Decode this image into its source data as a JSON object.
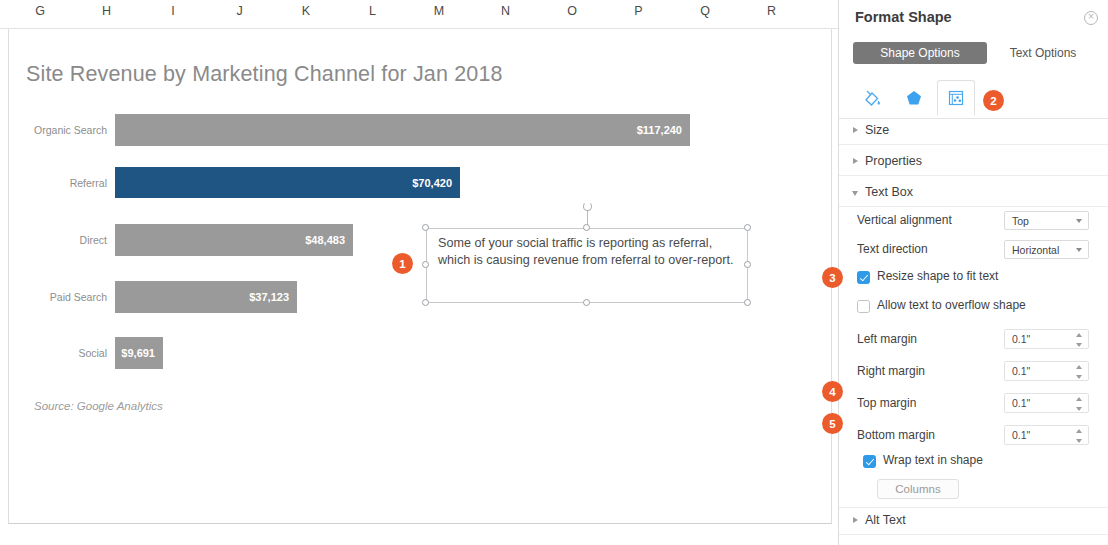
{
  "spreadsheet": {
    "columns": [
      "G",
      "H",
      "I",
      "J",
      "K",
      "L",
      "M",
      "N",
      "O",
      "P",
      "Q",
      "R"
    ]
  },
  "chart_data": {
    "type": "bar",
    "orientation": "horizontal",
    "title": "Site Revenue by Marketing Channel for Jan 2018",
    "source": "Source: Google Analytics",
    "xlabel": "",
    "ylabel": "",
    "grid": false,
    "legend": "none",
    "xlim": [
      0,
      117240
    ],
    "categories": [
      "Organic Search",
      "Referral",
      "Direct",
      "Paid Search",
      "Social"
    ],
    "values": [
      117240,
      70420,
      48483,
      37123,
      9691
    ],
    "value_labels": [
      "$117,240",
      "$70,420",
      "$48,483",
      "$37,123",
      "$9,691"
    ],
    "colors": [
      "#9a9a9a",
      "#1f5582",
      "#9a9a9a",
      "#9a9a9a",
      "#9a9a9a"
    ],
    "highlight_category": "Referral",
    "highlight_color": "#1f5582",
    "base_color": "#9a9a9a"
  },
  "annotation": {
    "text": "Some of your social traffic is reporting as referral, which is causing revenue from referral to over-report."
  },
  "badges": [
    {
      "label": "1"
    },
    {
      "label": "2"
    },
    {
      "label": "3"
    },
    {
      "label": "4"
    },
    {
      "label": "5"
    }
  ],
  "panel": {
    "title": "Format Shape",
    "close_icon": "close-icon",
    "tabs": [
      {
        "label": "Shape Options",
        "active": true
      },
      {
        "label": "Text Options",
        "active": false
      }
    ],
    "icon_tabs": [
      {
        "name": "fill-line-icon",
        "selected": false
      },
      {
        "name": "effects-pentagon-icon",
        "selected": false
      },
      {
        "name": "size-properties-icon",
        "selected": true
      }
    ],
    "sections": [
      {
        "label": "Size",
        "expanded": false
      },
      {
        "label": "Properties",
        "expanded": false
      },
      {
        "label": "Text Box",
        "expanded": true
      },
      {
        "label": "Alt Text",
        "expanded": false
      }
    ],
    "text_box": {
      "vertical_alignment": {
        "label": "Vertical alignment",
        "value": "Top"
      },
      "text_direction": {
        "label": "Text direction",
        "value": "Horizontal"
      },
      "resize_shape": {
        "label": "Resize shape to fit text",
        "checked": true
      },
      "allow_overflow": {
        "label": "Allow text to overflow shape",
        "checked": false
      },
      "left_margin": {
        "label": "Left margin",
        "value": "0.1\""
      },
      "right_margin": {
        "label": "Right margin",
        "value": "0.1\""
      },
      "top_margin": {
        "label": "Top margin",
        "value": "0.1\""
      },
      "bottom_margin": {
        "label": "Bottom margin",
        "value": "0.1\""
      },
      "wrap_text": {
        "label": "Wrap text in shape",
        "checked": true
      },
      "columns_button": "Columns"
    }
  },
  "theme": {
    "accent_orange": "#ec5b2b",
    "checkbox_blue": "#2f9ae8",
    "bar_blue": "#1f5582",
    "bar_gray": "#9a9a9a",
    "tab_active_gray": "#787878"
  }
}
